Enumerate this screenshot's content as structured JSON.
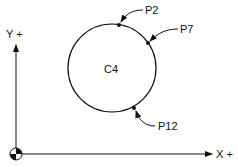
{
  "diagram": {
    "axes": {
      "x_label": "X +",
      "y_label": "Y +"
    },
    "circle": {
      "label": "C4"
    },
    "points": [
      {
        "label": "P2"
      },
      {
        "label": "P7"
      },
      {
        "label": "P12"
      }
    ],
    "colors": {
      "ink": "#111111",
      "background": "#ffffff"
    }
  }
}
